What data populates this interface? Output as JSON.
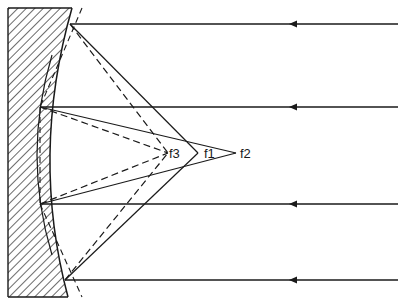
{
  "diagram": {
    "type": "concave mirror reflection / focal points",
    "colors": {
      "stroke": "#1a1a1a",
      "background": "#ffffff"
    },
    "mirror": {
      "hatched_block": true,
      "outer_surface": "solid curve",
      "inner_surface": "solid deeper arc",
      "alternate_surface": "dashed flat/tilted profile"
    },
    "incident_rays": [
      {
        "y": 24,
        "direction": "left"
      },
      {
        "y": 107,
        "direction": "left"
      },
      {
        "y": 204,
        "direction": "left"
      },
      {
        "y": 280,
        "direction": "left"
      }
    ],
    "focal_points": [
      {
        "id": "f3",
        "label": "f3"
      },
      {
        "id": "f1",
        "label": "f1"
      },
      {
        "id": "f2",
        "label": "f2"
      }
    ]
  }
}
